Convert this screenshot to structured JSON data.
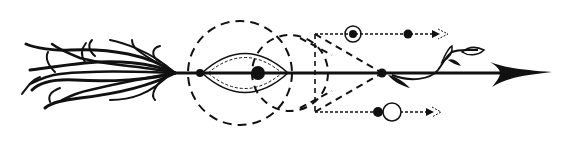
{
  "illustration": {
    "title": "",
    "subject": "geometric arrow with feathers, dashed circles, triangle and vine",
    "colors": {
      "ink": "#111111",
      "background": "#ffffff"
    },
    "elements": [
      "arrow-shaft",
      "feather-fletching",
      "arrowhead",
      "dashed-circle-large",
      "dashed-circle-small",
      "lens-shape",
      "dashed-triangle",
      "dashed-rectangle",
      "top-dotted-line-with-nodes",
      "bottom-dotted-line-with-nodes",
      "vine-with-leaves"
    ]
  }
}
